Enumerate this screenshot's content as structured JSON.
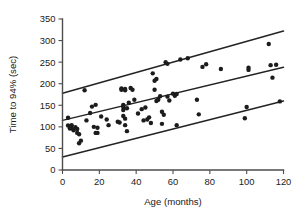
{
  "chart_data": {
    "type": "scatter",
    "title": "",
    "xlabel": "Age (months)",
    "ylabel": "Time to 94% (sec)",
    "xlim": [
      0,
      120
    ],
    "ylim": [
      0,
      350
    ],
    "xticks": [
      0,
      20,
      40,
      60,
      80,
      100,
      120
    ],
    "yticks": [
      0,
      50,
      100,
      150,
      200,
      250,
      300,
      350
    ],
    "xticklabels": [
      "0",
      "20",
      "40",
      "60",
      "80",
      "100",
      "120"
    ],
    "yticklabels": [
      "0",
      "50",
      "100",
      "150",
      "200",
      "250",
      "300",
      "350"
    ],
    "grid": false,
    "legend": null,
    "marker_color": "#1c1c1c",
    "line_color": "#232323",
    "axis_color": "#4d4d4d",
    "points": [
      [
        3,
        121
      ],
      [
        3,
        103
      ],
      [
        4,
        100
      ],
      [
        4,
        96
      ],
      [
        5,
        104
      ],
      [
        5,
        97
      ],
      [
        6,
        92
      ],
      [
        7,
        99
      ],
      [
        8,
        86
      ],
      [
        8,
        95
      ],
      [
        9,
        83
      ],
      [
        9,
        62
      ],
      [
        10,
        68
      ],
      [
        12,
        185
      ],
      [
        13,
        115
      ],
      [
        15,
        132
      ],
      [
        16,
        147
      ],
      [
        17,
        100
      ],
      [
        18,
        151
      ],
      [
        18,
        86
      ],
      [
        19,
        98
      ],
      [
        19,
        86
      ],
      [
        21,
        124
      ],
      [
        24,
        117
      ],
      [
        25,
        104
      ],
      [
        30,
        112
      ],
      [
        31,
        110
      ],
      [
        32,
        189
      ],
      [
        32,
        186
      ],
      [
        33,
        146
      ],
      [
        33,
        139
      ],
      [
        33,
        151
      ],
      [
        33,
        125
      ],
      [
        34,
        185
      ],
      [
        34,
        188
      ],
      [
        34,
        119
      ],
      [
        34,
        104
      ],
      [
        35,
        143
      ],
      [
        35,
        90
      ],
      [
        36,
        156
      ],
      [
        37,
        190
      ],
      [
        38,
        186
      ],
      [
        39,
        163
      ],
      [
        41,
        131
      ],
      [
        43,
        141
      ],
      [
        44,
        115
      ],
      [
        45,
        145
      ],
      [
        46,
        117
      ],
      [
        47,
        122
      ],
      [
        48,
        109
      ],
      [
        49,
        224
      ],
      [
        50,
        207
      ],
      [
        50,
        186
      ],
      [
        51,
        211
      ],
      [
        51,
        160
      ],
      [
        52,
        163
      ],
      [
        53,
        171
      ],
      [
        54,
        135
      ],
      [
        54,
        107
      ],
      [
        55,
        128
      ],
      [
        56,
        250
      ],
      [
        57,
        246
      ],
      [
        57,
        170
      ],
      [
        58,
        161
      ],
      [
        60,
        177
      ],
      [
        61,
        172
      ],
      [
        62,
        176
      ],
      [
        62,
        104
      ],
      [
        64,
        256
      ],
      [
        68,
        259
      ],
      [
        73,
        163
      ],
      [
        74,
        129
      ],
      [
        76,
        239
      ],
      [
        78,
        245
      ],
      [
        86,
        234
      ],
      [
        99,
        120
      ],
      [
        100,
        146
      ],
      [
        101,
        237
      ],
      [
        101,
        232
      ],
      [
        112,
        292
      ],
      [
        113,
        243
      ],
      [
        114,
        214
      ],
      [
        116,
        244
      ],
      [
        118,
        159
      ]
    ],
    "lines": [
      {
        "name": "upper-band",
        "x": [
          0,
          120
        ],
        "y": [
          178,
          322
        ]
      },
      {
        "name": "fit-line",
        "x": [
          0,
          120
        ],
        "y": [
          115,
          238
        ]
      },
      {
        "name": "lower-band",
        "x": [
          0,
          120
        ],
        "y": [
          30,
          160
        ]
      }
    ]
  }
}
